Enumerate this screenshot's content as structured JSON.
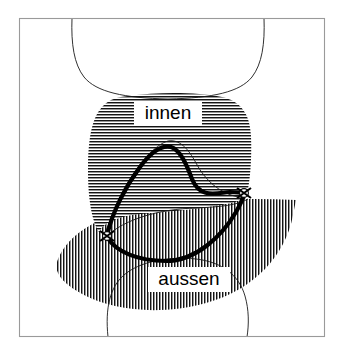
{
  "figure": {
    "title_visible": false,
    "background_color": "#ffffff",
    "frame": {
      "x": 19,
      "y": 18,
      "width": 306,
      "height": 319,
      "stroke_color": "#9a9a9a"
    },
    "labels": [
      {
        "id": "innen",
        "text": "innen",
        "x": 168,
        "y": 114,
        "font_size": 19,
        "color": "#000000",
        "background_color": "#ffffff",
        "box_x": 134,
        "box_y": 101,
        "box_width": 68,
        "box_height": 25
      },
      {
        "id": "aussen",
        "text": "aussen",
        "x": 189,
        "y": 280,
        "font_size": 19,
        "color": "#000000",
        "background_color": "#ffffff",
        "box_x": 148,
        "box_y": 267,
        "box_width": 82,
        "box_height": 25
      }
    ],
    "regions": [
      {
        "id": "innen-region",
        "label": "innen",
        "hatch": "horizontal",
        "hatch_color": "#111111",
        "hatch_spacing": 3
      },
      {
        "id": "aussen-region",
        "label": "aussen",
        "hatch": "vertical",
        "hatch_color": "#111111",
        "hatch_spacing": 3
      }
    ],
    "markers": [
      {
        "id": "marker-left",
        "x": 107,
        "y": 236,
        "type": "cross-circle"
      },
      {
        "id": "marker-right",
        "x": 244,
        "y": 194,
        "type": "cross-circle"
      }
    ],
    "curves": [
      {
        "id": "upper-organ-outline",
        "style": "thin"
      },
      {
        "id": "lower-organ-outline",
        "style": "thin"
      },
      {
        "id": "leaflet-inner-outline",
        "style": "thin"
      },
      {
        "id": "leaflet-main-outline",
        "style": "thick"
      }
    ]
  }
}
